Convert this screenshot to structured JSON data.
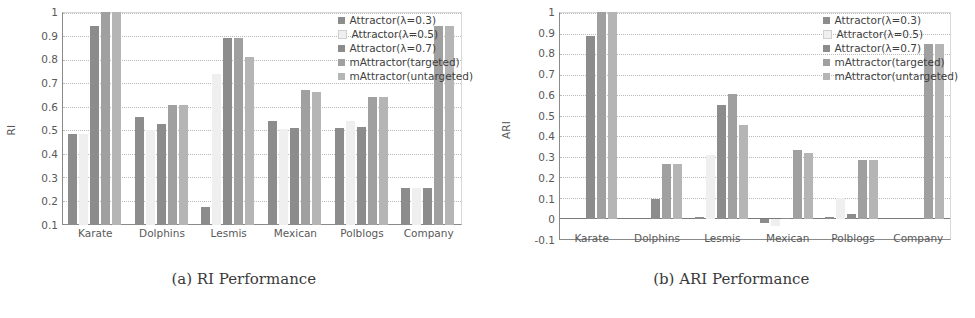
{
  "figure": {
    "captions": [
      "(a) RI Performance",
      "(b) ARI Performance"
    ]
  },
  "legend": {
    "position": "top-right",
    "items": [
      {
        "label": "Attractor(λ=0.3)",
        "color": "#8c8c8c"
      },
      {
        "label": "Attractor(λ=0.5)",
        "color": "#efefef"
      },
      {
        "label": "Attractor(λ=0.7)",
        "color": "#8c8c8c"
      },
      {
        "label": "mAttractor(targeted)",
        "color": "#a0a0a0"
      },
      {
        "label": "mAttractor(untargeted)",
        "color": "#b5b5b5"
      }
    ]
  },
  "chart_data": [
    {
      "type": "bar",
      "title": "(a) RI Performance",
      "xlabel": "",
      "ylabel": "RI",
      "ylim": [
        0.1,
        1.0
      ],
      "ytick_values": [
        1,
        0.9,
        0.8,
        0.7,
        0.6,
        0.5,
        0.4,
        0.3,
        0.2,
        0.1
      ],
      "ytick_labels": [
        "1",
        "0.9",
        "0.8",
        "0.7",
        "0.6",
        "0.5",
        "0.4",
        "0.3",
        "0.2",
        "0.1"
      ],
      "grid": true,
      "legend_position": "upper right",
      "categories": [
        "Karate",
        "Dolphins",
        "Lesmis",
        "Mexican",
        "Polblogs",
        "Company"
      ],
      "series": [
        {
          "name": "Attractor(λ=0.3)",
          "color": "#8c8c8c",
          "values": [
            0.485,
            0.555,
            0.175,
            0.54,
            0.508,
            0.255
          ]
        },
        {
          "name": "Attractor(λ=0.5)",
          "color": "#efefef",
          "values": [
            0.485,
            0.5,
            0.74,
            0.505,
            0.54,
            0.255
          ]
        },
        {
          "name": "Attractor(λ=0.7)",
          "color": "#8c8c8c",
          "values": [
            0.94,
            0.525,
            0.89,
            0.51,
            0.513,
            0.255
          ]
        },
        {
          "name": "mAttractor(targeted)",
          "color": "#a0a0a0",
          "values": [
            1.0,
            0.605,
            0.89,
            0.67,
            0.64,
            0.94
          ]
        },
        {
          "name": "mAttractor(untargeted)",
          "color": "#b5b5b5",
          "values": [
            1.0,
            0.605,
            0.81,
            0.66,
            0.64,
            0.94
          ]
        }
      ]
    },
    {
      "type": "bar",
      "title": "(b) ARI Performance",
      "xlabel": "",
      "ylabel": "ARI",
      "ylim": [
        -0.1,
        1.0
      ],
      "ytick_values": [
        1,
        0.9,
        0.8,
        0.7,
        0.6,
        0.5,
        0.4,
        0.3,
        0.2,
        0.1,
        0,
        -0.1
      ],
      "ytick_labels": [
        "1",
        "0.9",
        "0.8",
        "0.7",
        "0.6",
        "0.5",
        "0.4",
        "0.3",
        "0.2",
        "0.1",
        "0",
        "-0.1"
      ],
      "grid": true,
      "legend_position": "upper right",
      "categories": [
        "Karate",
        "Dolphins",
        "Lesmis",
        "Mexican",
        "Polblogs",
        "Company"
      ],
      "series": [
        {
          "name": "Attractor(λ=0.3)",
          "color": "#8c8c8c",
          "values": [
            0.0,
            0.0,
            0.01,
            -0.02,
            0.01,
            0.0
          ]
        },
        {
          "name": "Attractor(λ=0.5)",
          "color": "#efefef",
          "values": [
            0.0,
            0.0,
            0.31,
            -0.03,
            0.105,
            0.0
          ]
        },
        {
          "name": "Attractor(λ=0.7)",
          "color": "#8c8c8c",
          "values": [
            0.885,
            0.1,
            0.55,
            0.005,
            0.025,
            0.0
          ]
        },
        {
          "name": "mAttractor(targeted)",
          "color": "#a0a0a0",
          "values": [
            1.0,
            0.265,
            0.605,
            0.335,
            0.285,
            0.845
          ]
        },
        {
          "name": "mAttractor(untargeted)",
          "color": "#b5b5b5",
          "values": [
            1.0,
            0.265,
            0.455,
            0.32,
            0.285,
            0.845
          ]
        }
      ]
    }
  ]
}
